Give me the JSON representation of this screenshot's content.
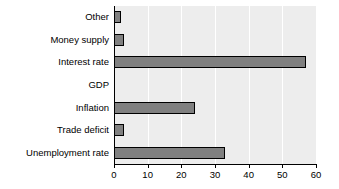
{
  "chart_data": {
    "type": "bar",
    "orientation": "horizontal",
    "title": "",
    "subtitle": "",
    "xlabel": "",
    "ylabel": "",
    "categories": [
      "Other",
      "Money supply",
      "Interest rate",
      "GDP",
      "Inflation",
      "Trade deficit",
      "Unemployment rate"
    ],
    "values": [
      2,
      3,
      57,
      0,
      24,
      3,
      33
    ],
    "xlim": [
      0,
      60
    ],
    "xticks": [
      0,
      10,
      20,
      30,
      40,
      50,
      60
    ],
    "xtick_labels": [
      "0",
      "10",
      "20",
      "30",
      "40",
      "50",
      "60"
    ],
    "grid": true,
    "grid_axis": "x",
    "legend": null,
    "legend_position": "none",
    "annotations": [],
    "colors": {
      "bar_fill": "#808080",
      "bar_edge": "#000000",
      "plot_background": "#ededed",
      "gridline": "#ffffff",
      "axis": "#000000",
      "text": "#000000",
      "figure_background": "#ffffff"
    }
  }
}
